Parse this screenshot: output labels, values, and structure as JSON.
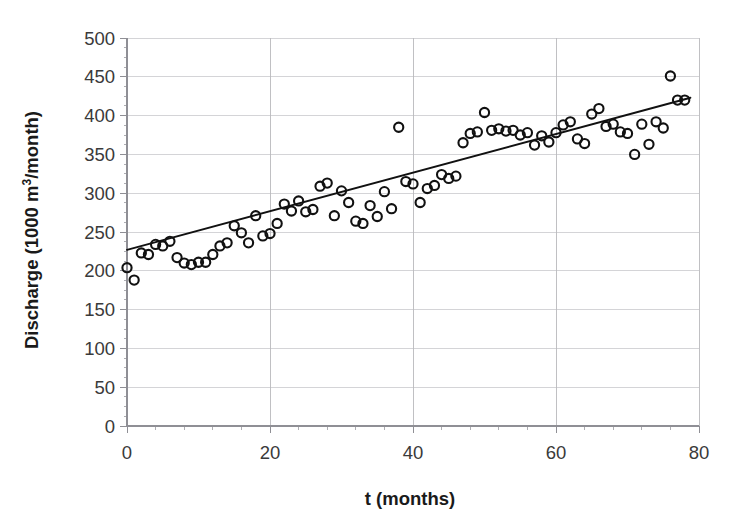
{
  "chart_data": {
    "type": "scatter",
    "title": "",
    "xlabel": "t (months)",
    "ylabel_parts": {
      "before": "Discharge (1000 m",
      "superscript": "3",
      "after": "/month)"
    },
    "ylabel": "Discharge (1000 m3/month)",
    "xlim": [
      0,
      80
    ],
    "ylim": [
      0,
      500
    ],
    "xticks": [
      0,
      20,
      40,
      60,
      80
    ],
    "xtick_labels": [
      "0",
      "20",
      "40",
      "60",
      "80"
    ],
    "x_minor_tick_interval": 4,
    "yticks": [
      0,
      50,
      100,
      150,
      200,
      250,
      300,
      350,
      400,
      450,
      500
    ],
    "ytick_labels": [
      "0",
      "50",
      "100",
      "150",
      "200",
      "250",
      "300",
      "350",
      "400",
      "450",
      "500"
    ],
    "y_minor_tick_interval": 12.5,
    "grid": {
      "horizontal": true,
      "vertical": true,
      "color": "#c9c9cd"
    },
    "legend": null,
    "marker": {
      "shape": "open-circle",
      "radius": 4.6,
      "edge_color": "#111111",
      "fill": "none"
    },
    "trendline": {
      "type": "linear",
      "color": "#111111",
      "x_start": 0,
      "y_start": 227,
      "x_end": 78.8,
      "y_end": 423,
      "slope": 2.487,
      "intercept": 227
    },
    "x": [
      0,
      1,
      2,
      3,
      4,
      5,
      6,
      7,
      8,
      9,
      10,
      11,
      12,
      13,
      14,
      15,
      16,
      17,
      18,
      19,
      20,
      21,
      22,
      23,
      24,
      25,
      26,
      27,
      28,
      29,
      30,
      31,
      32,
      33,
      34,
      35,
      36,
      37,
      38,
      39,
      40,
      41,
      42,
      43,
      44,
      45,
      46,
      47,
      48,
      49,
      50,
      51,
      52,
      53,
      54,
      55,
      56,
      57,
      58,
      59,
      60,
      61,
      62,
      63,
      64,
      65,
      66,
      67,
      68,
      69,
      70,
      71,
      72,
      73,
      74,
      75,
      76,
      77,
      78
    ],
    "y": [
      204,
      188,
      223,
      221,
      234,
      232,
      238,
      217,
      210,
      208,
      211,
      211,
      221,
      232,
      236,
      258,
      249,
      236,
      271,
      245,
      248,
      261,
      286,
      277,
      290,
      276,
      279,
      309,
      313,
      271,
      303,
      288,
      264,
      261,
      284,
      270,
      302,
      280,
      385,
      315,
      312,
      288,
      306,
      310,
      324,
      319,
      322,
      365,
      377,
      379,
      404,
      381,
      383,
      380,
      381,
      375,
      378,
      362,
      374,
      366,
      378,
      388,
      392,
      370,
      364,
      402,
      409,
      386,
      389,
      379,
      377,
      350,
      389,
      363,
      392,
      384,
      451,
      420,
      420
    ],
    "n_points": 79
  },
  "axis": {
    "x_title": "t (months)",
    "y_title_before": "Discharge (1000 m",
    "y_title_sup": "3",
    "y_title_after": "/month)"
  }
}
